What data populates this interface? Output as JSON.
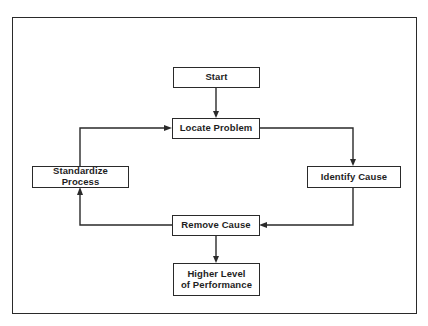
{
  "diagram": {
    "type": "flowchart",
    "title": "",
    "colors": {
      "line": "#2a2a2a",
      "text": "#1e1e1e",
      "background": "#ffffff"
    },
    "nodes": [
      {
        "id": "start",
        "label": "Start"
      },
      {
        "id": "locate",
        "label": "Locate Problem"
      },
      {
        "id": "identify",
        "label": "Identify Cause"
      },
      {
        "id": "remove",
        "label": "Remove Cause"
      },
      {
        "id": "standardize",
        "label": "Standardize Process"
      },
      {
        "id": "higher",
        "label": "Higher Level\nof Performance"
      }
    ],
    "edges": [
      {
        "from": "start",
        "to": "locate"
      },
      {
        "from": "locate",
        "to": "identify"
      },
      {
        "from": "identify",
        "to": "remove"
      },
      {
        "from": "remove",
        "to": "standardize"
      },
      {
        "from": "standardize",
        "to": "locate"
      },
      {
        "from": "remove",
        "to": "higher"
      }
    ]
  }
}
